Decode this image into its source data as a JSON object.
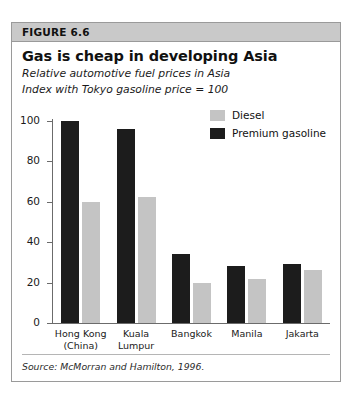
{
  "figure": {
    "header_label": "FIGURE 6.6",
    "source_note": "Source: McMorran and Hamilton, 1996."
  },
  "colors": {
    "header_band": "#c9c9c9",
    "frame_border": "#9a9a9a",
    "diesel": "#c4c4c4",
    "premium_gasoline": "#1c1c1c",
    "axis": "#6b6b6b"
  },
  "chart_data": {
    "type": "bar",
    "title": "Gas is cheap in developing Asia",
    "subtitle_1": "Relative automotive fuel prices in Asia",
    "subtitle_2": "Index with Tokyo gasoline price = 100",
    "xlabel": "",
    "ylabel": "",
    "ylim": [
      0,
      100
    ],
    "yticks": [
      0,
      20,
      40,
      60,
      80,
      100
    ],
    "grid": false,
    "legend_position": "top-right",
    "categories": [
      "Hong Kong\n(China)",
      "Kuala Lumpur",
      "Bangkok",
      "Manila",
      "Jakarta"
    ],
    "category_lines": [
      [
        "Hong Kong",
        "(China)"
      ],
      [
        "Kuala Lumpur",
        ""
      ],
      [
        "Bangkok",
        ""
      ],
      [
        "Manila",
        ""
      ],
      [
        "Jakarta",
        ""
      ]
    ],
    "series": [
      {
        "name": "Premium gasoline",
        "color": "#1c1c1c",
        "values": [
          100,
          96,
          34,
          28,
          29
        ]
      },
      {
        "name": "Diesel",
        "color": "#c4c4c4",
        "values": [
          60,
          62.5,
          20,
          22,
          26
        ]
      }
    ]
  }
}
